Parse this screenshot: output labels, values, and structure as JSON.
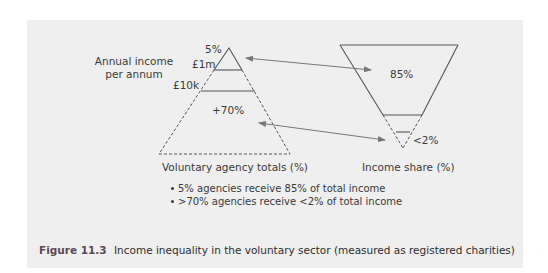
{
  "figure": {
    "label": "Figure 11.3",
    "caption": "Income inequality in the voluntary sector (measured as registered charities)"
  },
  "left_pyramid": {
    "axis_label_line1": "Annual income",
    "axis_label_line2": "per annum",
    "apex_label": "5%",
    "band1_label": "£1m",
    "band2_label": "£10k",
    "base_label": "+70%",
    "title": "Voluntary agency totals (%)"
  },
  "right_pyramid": {
    "top_label": "85%",
    "bottom_label": "<2%",
    "title": "Income share (%)"
  },
  "bullets": [
    "5% agencies receive 85% of total income",
    ">70% agencies receive <2% of total income"
  ],
  "colors": {
    "panel_bg": "#efefef",
    "line": "#555555",
    "arrow": "#777777",
    "figure_label": "#5a4a55"
  }
}
